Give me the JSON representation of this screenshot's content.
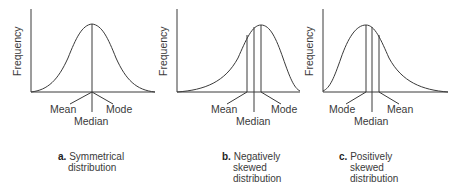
{
  "y_axis_label": "Frequency",
  "panels": [
    {
      "id": "a",
      "letter": "a.",
      "caption_line1": "Symmetrical",
      "caption_line2": "distribution",
      "caption_line3": "",
      "labels": {
        "left": "Mean",
        "center": "Median",
        "right": "Mode"
      }
    },
    {
      "id": "b",
      "letter": "b.",
      "caption_line1": "Negatively",
      "caption_line2": "skewed",
      "caption_line3": "distribution",
      "labels": {
        "left": "Mean",
        "center": "Median",
        "right": "Mode"
      }
    },
    {
      "id": "c",
      "letter": "c.",
      "caption_line1": "Positively",
      "caption_line2": "skewed",
      "caption_line3": "distribution",
      "labels": {
        "left": "Mode",
        "center": "Median",
        "right": "Mean"
      }
    }
  ],
  "colors": {
    "line": "#3a3a3a",
    "background": "#ffffff"
  }
}
